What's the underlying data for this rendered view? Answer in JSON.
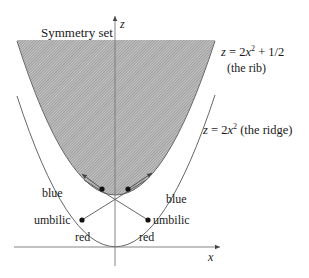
{
  "figure": {
    "title_label": "Symmetry set",
    "axes": {
      "z_label": "z",
      "x_label": "x"
    },
    "rib": {
      "equation_prefix": "z = 2",
      "equation_var": "x",
      "equation_exp": "2",
      "equation_suffix": " + 1/2",
      "caption": "(the rib)"
    },
    "ridge": {
      "equation_prefix": "z = 2",
      "equation_var": "x",
      "equation_exp": "2",
      "equation_suffix": " (the ridge)"
    },
    "labels": {
      "left_blue": "blue",
      "right_blue": "blue",
      "left_umbilic": "umbilic",
      "right_umbilic": "umbilic",
      "left_red": "red",
      "right_red": "red"
    },
    "colors": {
      "hatch_fill": "#9a9a9a",
      "curve_stroke": "#555555",
      "axis_stroke": "#777777",
      "dot_fill": "#111111"
    }
  }
}
